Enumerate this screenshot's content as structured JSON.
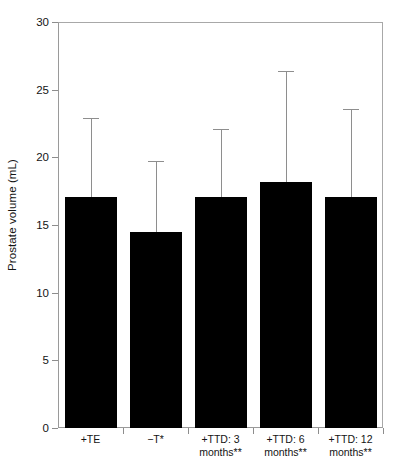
{
  "chart_data": {
    "type": "bar",
    "title": "",
    "xlabel": "",
    "ylabel": "Prostate volume (mL)",
    "categories": [
      "+TE",
      "−T*",
      "+TTD: 3 months**",
      "+TTD: 6 months**",
      "+TTD: 12 months**"
    ],
    "category_lines": [
      [
        "+TE"
      ],
      [
        "−T*"
      ],
      [
        "+TTD: 3",
        "months**"
      ],
      [
        "+TTD: 6",
        "months**"
      ],
      [
        "+TTD: 12",
        "months**"
      ]
    ],
    "values": [
      17.1,
      14.5,
      17.1,
      18.2,
      17.1
    ],
    "error_upper": [
      22.9,
      19.7,
      22.1,
      26.4,
      23.6
    ],
    "error_direction": "upper-only",
    "ylim": [
      0,
      30
    ],
    "yticks": [
      0,
      5,
      10,
      15,
      20,
      25,
      30
    ],
    "ytick_labels": [
      "0",
      "5",
      "10",
      "15",
      "20",
      "25",
      "30"
    ],
    "grid": false,
    "legend": null,
    "bar_color": "#000000",
    "error_color": "#8e8e8e",
    "axis_color": "#9a9a9a",
    "n_series": 1
  },
  "axis": {
    "y_title": "Prostate volume (mL)"
  }
}
